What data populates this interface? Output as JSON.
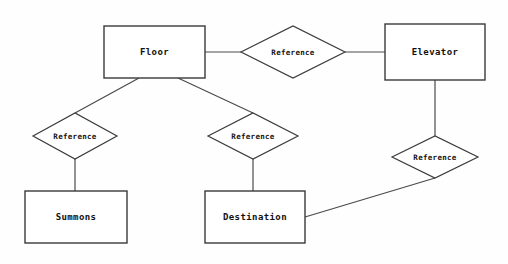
{
  "diagram": {
    "type": "entity-relationship-diagram",
    "background_color": "#fefefe",
    "line_color": "#3a3a3a",
    "text_color": "#111111",
    "entities": [
      {
        "id": "floor",
        "label": "Floor",
        "x": 104,
        "y": 26,
        "width": 101,
        "height": 52
      },
      {
        "id": "elevator",
        "label": "Elevator",
        "x": 385,
        "y": 24,
        "width": 100,
        "height": 56
      },
      {
        "id": "summons",
        "label": "Summons",
        "x": 25,
        "y": 191,
        "width": 102,
        "height": 52
      },
      {
        "id": "destination",
        "label": "Destination",
        "x": 205,
        "y": 191,
        "width": 100,
        "height": 52
      }
    ],
    "relationships": [
      {
        "id": "rel-floor-elevator",
        "label": "Reference",
        "cx": 293,
        "cy": 52,
        "rx": 52,
        "ry": 26
      },
      {
        "id": "rel-floor-summons",
        "label": "Reference",
        "cx": 75,
        "cy": 136,
        "rx": 42,
        "ry": 23
      },
      {
        "id": "rel-floor-destination",
        "label": "Reference",
        "cx": 253,
        "cy": 136,
        "rx": 45,
        "ry": 23
      },
      {
        "id": "rel-elevator-destination",
        "label": "Reference",
        "cx": 435,
        "cy": 157,
        "rx": 43,
        "ry": 21
      }
    ],
    "connectors": [
      {
        "id": "floor-to-rel1",
        "from": "floor",
        "to": "rel-floor-elevator",
        "points": "205,52 241,52"
      },
      {
        "id": "rel1-to-elevator",
        "from": "rel-floor-elevator",
        "to": "elevator",
        "points": "345,52 385,52"
      },
      {
        "id": "floor-to-rel2",
        "from": "floor",
        "to": "rel-floor-summons",
        "points": "139,78 75,113"
      },
      {
        "id": "rel2-to-summons",
        "from": "rel-floor-summons",
        "to": "summons",
        "points": "75,159 75,191"
      },
      {
        "id": "floor-to-rel3",
        "from": "floor",
        "to": "rel-floor-destination",
        "points": "178,78 253,113"
      },
      {
        "id": "rel3-to-destination",
        "from": "rel-floor-destination",
        "to": "destination",
        "points": "253,159 253,191"
      },
      {
        "id": "elevator-to-rel4",
        "from": "elevator",
        "to": "rel-elevator-destination",
        "points": "435,80 435,136"
      },
      {
        "id": "rel4-to-destination",
        "from": "rel-elevator-destination",
        "to": "destination",
        "points": "435,178 305,217"
      }
    ]
  }
}
